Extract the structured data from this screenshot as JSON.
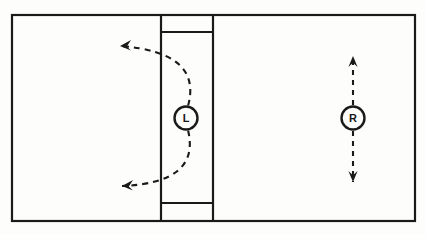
{
  "figure": {
    "background_color": "#fdfdfc",
    "stroke_color": "#1a1a1a",
    "frame": {
      "x": 12,
      "y": 15,
      "width": 403,
      "height": 206,
      "stroke_width": 2.2
    },
    "column": {
      "name": "center-column",
      "left_x": 161,
      "right_x": 213,
      "top_cap_y": 32,
      "bottom_cap_y": 203,
      "stroke_width": 2.2
    },
    "nodes": [
      {
        "id": "node-L",
        "label": "L",
        "cx": 186,
        "cy": 118,
        "r": 11.5,
        "stroke_width": 2.4,
        "font_size": 11
      },
      {
        "id": "node-R",
        "label": "R",
        "cx": 353,
        "cy": 118,
        "r": 11.5,
        "stroke_width": 2.4,
        "font_size": 11
      }
    ],
    "arrows": [
      {
        "id": "arc-upper-left",
        "kind": "dashed-arc",
        "description": "curved dashed arrow sweeping from L node upward and to the left",
        "from": {
          "x": 188,
          "y": 106
        },
        "control": {
          "x": 203,
          "y": 52
        },
        "to": {
          "x": 120,
          "y": 46
        },
        "head": "left",
        "dash": "6,5",
        "stroke_width": 2.1
      },
      {
        "id": "arc-lower-left",
        "kind": "dashed-arc",
        "description": "curved dashed arrow sweeping from L node downward and to the left",
        "from": {
          "x": 188,
          "y": 130
        },
        "control": {
          "x": 201,
          "y": 183
        },
        "to": {
          "x": 122,
          "y": 186
        },
        "head": "left",
        "dash": "6,5",
        "stroke_width": 2.1
      },
      {
        "id": "arrow-up-right",
        "kind": "dashed-line",
        "description": "dashed arrow pointing up from R node",
        "from": {
          "x": 353,
          "y": 105
        },
        "to": {
          "x": 353,
          "y": 56
        },
        "head": "up",
        "dash": "5,5",
        "stroke_width": 2.1
      },
      {
        "id": "arrow-down-right",
        "kind": "dashed-line",
        "description": "dashed arrow pointing down from R node",
        "from": {
          "x": 353,
          "y": 131
        },
        "to": {
          "x": 353,
          "y": 182
        },
        "head": "down",
        "dash": "5,5",
        "stroke_width": 2.1
      }
    ]
  }
}
